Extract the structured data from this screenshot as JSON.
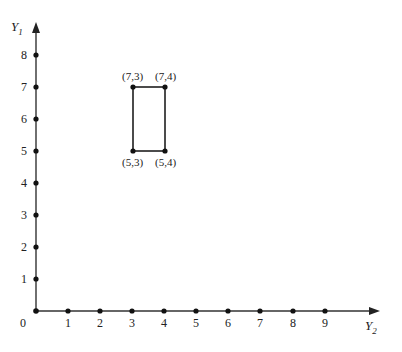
{
  "axes": {
    "y_label": "Y",
    "y_label_sub": "1",
    "x_label": "Y",
    "x_label_sub": "2",
    "origin_label": "0",
    "x_ticks": [
      "1",
      "2",
      "3",
      "4",
      "5",
      "6",
      "7",
      "8",
      "9"
    ],
    "y_ticks": [
      "1",
      "2",
      "3",
      "4",
      "5",
      "6",
      "7",
      "8"
    ]
  },
  "rectangle": {
    "corners": [
      {
        "label": "(7,3)"
      },
      {
        "label": "(7,4)"
      },
      {
        "label": "(5,3)"
      },
      {
        "label": "(5,4)"
      }
    ]
  },
  "colors": {
    "line": "#111111",
    "axis": "#333333"
  }
}
